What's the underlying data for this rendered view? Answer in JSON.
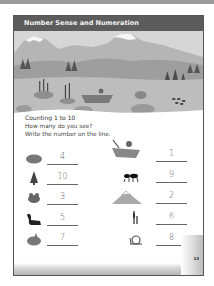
{
  "header": {
    "title": "Number Sense and Numeration"
  },
  "section": {
    "subtitle": "Counting 1 to 10",
    "instructions": [
      "How many do you see?",
      "Write the number on the line."
    ]
  },
  "items_left": [
    {
      "icon": "rock-icon",
      "answer": "4"
    },
    {
      "icon": "tree-icon",
      "answer": "10"
    },
    {
      "icon": "frog-icon",
      "answer": "3"
    },
    {
      "icon": "squirrel-icon",
      "answer": "5"
    },
    {
      "icon": "plant-pot-icon",
      "answer": "7"
    }
  ],
  "items_right": [
    {
      "icon": "boat-icon",
      "answer": "1"
    },
    {
      "icon": "ant-icon",
      "answer": "9"
    },
    {
      "icon": "mountain-icon",
      "answer": "2"
    },
    {
      "icon": "cattail-icon",
      "answer": "6"
    },
    {
      "icon": "snail-icon",
      "answer": "8"
    }
  ],
  "page_number": "13",
  "colors": {
    "header_bg": "#5c5c5c",
    "border": "#555555"
  }
}
